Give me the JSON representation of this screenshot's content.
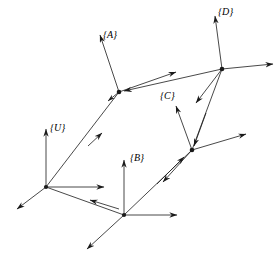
{
  "figure": {
    "width": 280,
    "height": 267,
    "background_color": "#ffffff",
    "line_color": "#1a1a1a",
    "label_color": "#000000"
  },
  "frames": [
    {
      "id": "U",
      "label": "{U}",
      "label_x": 50,
      "label_y": 123,
      "origin": {
        "x": 46,
        "y": 187
      },
      "axes": [
        {
          "name": "axis-up",
          "to_x": 46,
          "to_y": 129
        },
        {
          "name": "axis-right",
          "to_x": 104,
          "to_y": 187
        },
        {
          "name": "axis-down-left",
          "to_x": 17,
          "to_y": 209
        }
      ]
    },
    {
      "id": "A",
      "label": "{A}",
      "label_x": 103,
      "label_y": 30,
      "origin": {
        "x": 119,
        "y": 92
      },
      "axes": [
        {
          "name": "axis-up-left",
          "to_x": 100,
          "to_y": 35
        },
        {
          "name": "axis-up-right",
          "to_x": 176,
          "to_y": 72
        },
        {
          "name": "axis-down-left",
          "to_x": 108,
          "to_y": 101
        }
      ]
    },
    {
      "id": "B",
      "label": "{B}",
      "label_x": 130,
      "label_y": 153,
      "origin": {
        "x": 124,
        "y": 215
      },
      "axes": [
        {
          "name": "axis-up",
          "to_x": 124,
          "to_y": 160
        },
        {
          "name": "axis-right",
          "to_x": 177,
          "to_y": 215
        },
        {
          "name": "axis-down-left",
          "to_x": 87,
          "to_y": 249
        }
      ]
    },
    {
      "id": "C",
      "label": "{C}",
      "label_x": 160,
      "label_y": 91,
      "origin": {
        "x": 192,
        "y": 150
      },
      "axes": [
        {
          "name": "axis-up-left",
          "to_x": 176,
          "to_y": 106
        },
        {
          "name": "axis-right-up",
          "to_x": 246,
          "to_y": 134
        },
        {
          "name": "axis-down-left",
          "to_x": 163,
          "to_y": 182
        }
      ]
    },
    {
      "id": "D",
      "label": "{D}",
      "label_x": 218,
      "label_y": 7,
      "origin": {
        "x": 222,
        "y": 69
      },
      "axes": [
        {
          "name": "axis-up",
          "to_x": 215,
          "to_y": 16
        },
        {
          "name": "axis-right",
          "to_x": 273,
          "to_y": 64
        },
        {
          "name": "axis-down-left",
          "to_x": 196,
          "to_y": 103
        }
      ]
    }
  ],
  "transforms": [
    {
      "name": "transform-u-to-a",
      "from": "U",
      "to": "A",
      "from_x": 46,
      "from_y": 187,
      "to_x": 119,
      "to_y": 92,
      "arrow_at": "midpoint-forward"
    },
    {
      "name": "transform-u-to-b",
      "from": "U",
      "to": "B",
      "from_x": 46,
      "from_y": 187,
      "to_x": 124,
      "to_y": 215,
      "arrow_at": "midpoint-backward"
    },
    {
      "name": "transform-b-to-c",
      "from": "B",
      "to": "C",
      "from_x": 124,
      "from_y": 215,
      "to_x": 192,
      "to_y": 150,
      "arrow_at": "midpoint-forward"
    },
    {
      "name": "transform-c-to-d",
      "from": "C",
      "to": "D",
      "from_x": 192,
      "from_y": 150,
      "to_x": 222,
      "to_y": 69,
      "arrow_at": "midpoint-backward"
    },
    {
      "name": "transform-d-to-a",
      "from": "D",
      "to": "A",
      "from_x": 222,
      "from_y": 69,
      "to_x": 119,
      "to_y": 92,
      "arrow_at": "end"
    }
  ]
}
